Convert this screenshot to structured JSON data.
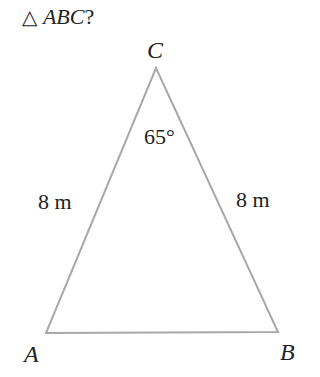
{
  "question": {
    "symbol": "△",
    "triangle_name": "ABC",
    "suffix": "?"
  },
  "diagram": {
    "type": "isosceles-triangle",
    "stroke_color": "#a8a8a8",
    "vertices": {
      "A": {
        "label": "A",
        "x": 46,
        "y": 333
      },
      "B": {
        "label": "B",
        "x": 278,
        "y": 332
      },
      "C": {
        "label": "C",
        "x": 156,
        "y": 68
      }
    },
    "side_labels": {
      "AC": "8 m",
      "BC": "8 m"
    },
    "angle_label": {
      "vertex": "C",
      "text": "65°"
    }
  }
}
